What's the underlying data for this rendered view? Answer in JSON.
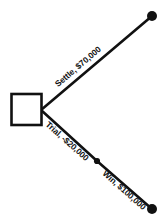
{
  "diagram": {
    "type": "decision-tree",
    "colors": {
      "background": "#ffffff",
      "stroke": "#111111",
      "node_fill": "#ffffff",
      "terminal_fill": "#111111"
    },
    "nodes": [
      {
        "id": "decision",
        "kind": "decision-square",
        "shape": "square",
        "x": 26,
        "y": 109,
        "size": 30
      },
      {
        "id": "settle-terminal",
        "kind": "terminal",
        "shape": "filled-circle",
        "x": 152,
        "y": 16,
        "radius": 5
      },
      {
        "id": "trial-chance",
        "kind": "chance",
        "shape": "filled-circle",
        "x": 97,
        "y": 161,
        "radius": 3.1
      },
      {
        "id": "win-terminal",
        "kind": "terminal",
        "shape": "filled-circle",
        "x": 152,
        "y": 209,
        "radius": 5
      }
    ],
    "edges": [
      {
        "id": "settle",
        "from": "decision",
        "to": "settle-terminal",
        "label": "Settle, $70,000",
        "option": "Settle",
        "value": "$70,000",
        "amount": 70000,
        "x1": 41,
        "y1": 110,
        "x2": 152,
        "y2": 16,
        "angle_deg": -40.3
      },
      {
        "id": "trial",
        "from": "decision",
        "to": "trial-chance",
        "label": "Trial, -$20,000",
        "option": "Trial",
        "value": "-$20,000",
        "amount": -20000,
        "x1": 41,
        "y1": 110,
        "x2": 97,
        "y2": 161,
        "angle_deg": 41.7
      },
      {
        "id": "win",
        "from": "trial-chance",
        "to": "win-terminal",
        "label": "Win, $100,000",
        "option": "Win",
        "value": "$100,000",
        "amount": 100000,
        "x1": 97,
        "y1": 161,
        "x2": 152,
        "y2": 209,
        "angle_deg": 41.7
      }
    ]
  }
}
